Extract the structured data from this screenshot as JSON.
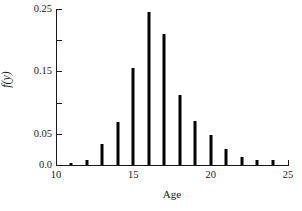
{
  "chart_data": {
    "type": "bar",
    "title": "",
    "subtitle": "",
    "xlabel": "Age",
    "ylabel": "f̂(y)",
    "ylabel_base": "f",
    "ylabel_hat": "ˆ",
    "ylabel_suffix": "(y)",
    "grid": false,
    "legend": "none",
    "xlim": [
      10,
      25
    ],
    "ylim": [
      0.0,
      0.25
    ],
    "x_tick_labels": [
      "10",
      "15",
      "20",
      "25"
    ],
    "x_tick_values": [
      10,
      15,
      20,
      25
    ],
    "y_tick_labels": [
      "0.0",
      "",
      "0.05",
      "",
      "0.15",
      "",
      "0.25"
    ],
    "y_tick_values": [
      0.0,
      0.025,
      0.05,
      0.1,
      0.15,
      0.2,
      0.25
    ],
    "y_labeled_ticks": [
      {
        "value": 0.25,
        "label": "0.25"
      },
      {
        "value": 0.2,
        "label": ""
      },
      {
        "value": 0.15,
        "label": "0.15"
      },
      {
        "value": 0.1,
        "label": ""
      },
      {
        "value": 0.05,
        "label": "0.05"
      },
      {
        "value": 0.0,
        "label": "0.0"
      }
    ],
    "categories": [
      11,
      12,
      13,
      14,
      15,
      16,
      17,
      18,
      19,
      20,
      21,
      22,
      23,
      24
    ],
    "values": [
      0.003,
      0.008,
      0.033,
      0.069,
      0.156,
      0.245,
      0.21,
      0.112,
      0.071,
      0.048,
      0.026,
      0.013,
      0.008,
      0.008
    ],
    "bar_color": "#000000",
    "axis_color": "#1a1a1a",
    "background_color": "#ffffff"
  }
}
